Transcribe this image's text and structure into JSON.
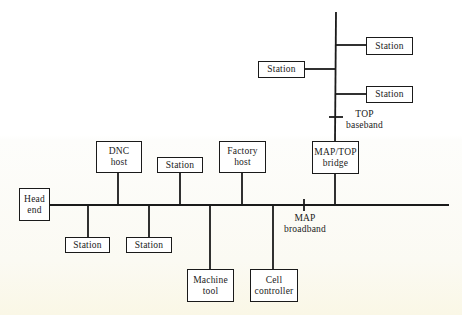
{
  "diagram": {
    "type": "network-topology",
    "line_color": "#1a1a1a",
    "networks": {
      "map": {
        "line1": "MAP",
        "line2": "broadband"
      },
      "top": {
        "line1": "TOP",
        "line2": "baseband"
      }
    },
    "nodes": {
      "head_end": {
        "line1": "Head",
        "line2": "end"
      },
      "dnc_host": {
        "line1": "DNC",
        "line2": "host"
      },
      "station_top_main": {
        "line1": "Station"
      },
      "factory_host": {
        "line1": "Factory",
        "line2": "host"
      },
      "bridge": {
        "line1": "MAP/TOP",
        "line2": "bridge"
      },
      "station_bottom_1": {
        "line1": "Station"
      },
      "station_bottom_2": {
        "line1": "Station"
      },
      "machine_tool": {
        "line1": "Machine",
        "line2": "tool"
      },
      "cell_controller": {
        "line1": "Cell",
        "line2": "controller"
      },
      "top_station_1": {
        "line1": "Station"
      },
      "top_station_2": {
        "line1": "Station"
      },
      "top_station_3": {
        "line1": "Station"
      }
    },
    "connections": [
      [
        "head_end",
        "map"
      ],
      [
        "dnc_host",
        "map"
      ],
      [
        "station_top_main",
        "map"
      ],
      [
        "factory_host",
        "map"
      ],
      [
        "bridge",
        "map"
      ],
      [
        "station_bottom_1",
        "map"
      ],
      [
        "station_bottom_2",
        "map"
      ],
      [
        "machine_tool",
        "map"
      ],
      [
        "cell_controller",
        "map"
      ],
      [
        "bridge",
        "top"
      ],
      [
        "top_station_1",
        "top"
      ],
      [
        "top_station_2",
        "top"
      ],
      [
        "top_station_3",
        "top"
      ]
    ]
  }
}
